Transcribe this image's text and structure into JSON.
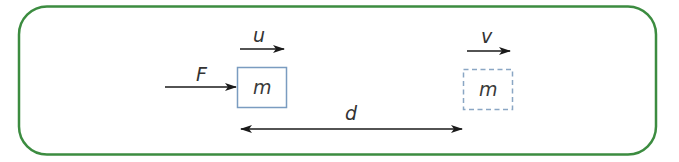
{
  "diagram": {
    "type": "physics-work-energy",
    "frame": {
      "border_color": "#3c8c40"
    },
    "force": {
      "label": "F"
    },
    "initial_block": {
      "mass_label": "m",
      "velocity_label": "u",
      "border_style": "solid",
      "border_color": "#7a9cc0"
    },
    "final_block": {
      "mass_label": "m",
      "velocity_label": "v",
      "border_style": "dashed",
      "border_color": "#8aa6c4"
    },
    "displacement": {
      "label": "d"
    }
  }
}
